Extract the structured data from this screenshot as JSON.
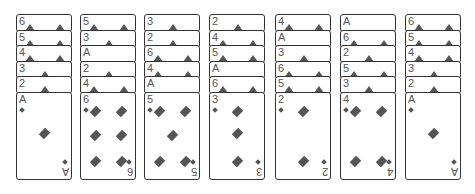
{
  "game": {
    "type": "solitaire-tableau",
    "suit_colors": {
      "diamond": "#555555"
    },
    "columns": [
      {
        "stack": [
          "6",
          "5",
          "4",
          "3",
          "2"
        ],
        "top": "A"
      },
      {
        "stack": [
          "5",
          "3",
          "A",
          "2",
          "4"
        ],
        "top": "6"
      },
      {
        "stack": [
          "3",
          "2",
          "6",
          "4",
          "A"
        ],
        "top": "5"
      },
      {
        "stack": [
          "2",
          "4",
          "5",
          "A",
          "6"
        ],
        "top": "3"
      },
      {
        "stack": [
          "4",
          "A",
          "3",
          "6",
          "5"
        ],
        "top": "2"
      },
      {
        "stack": [
          "A",
          "6",
          "2",
          "5",
          "3"
        ],
        "top": "4"
      },
      {
        "stack": [
          "6",
          "5",
          "4",
          "3",
          "2"
        ],
        "top": "A"
      }
    ]
  }
}
